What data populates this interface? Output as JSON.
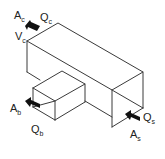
{
  "diagram": {
    "type": "duct-tee-junction",
    "labels": {
      "combined": {
        "area": "A",
        "area_sub": "c",
        "flow": "Q",
        "flow_sub": "c",
        "velocity": "V",
        "velocity_sub": "c"
      },
      "branch": {
        "area": "A",
        "area_sub": "b",
        "flow": "Q",
        "flow_sub": "b"
      },
      "straight": {
        "area": "A",
        "area_sub": "s",
        "flow": "Q",
        "flow_sub": "s"
      }
    },
    "colors": {
      "line": "#3a3a3a",
      "arrow": "#111111",
      "background": "#ffffff"
    }
  }
}
